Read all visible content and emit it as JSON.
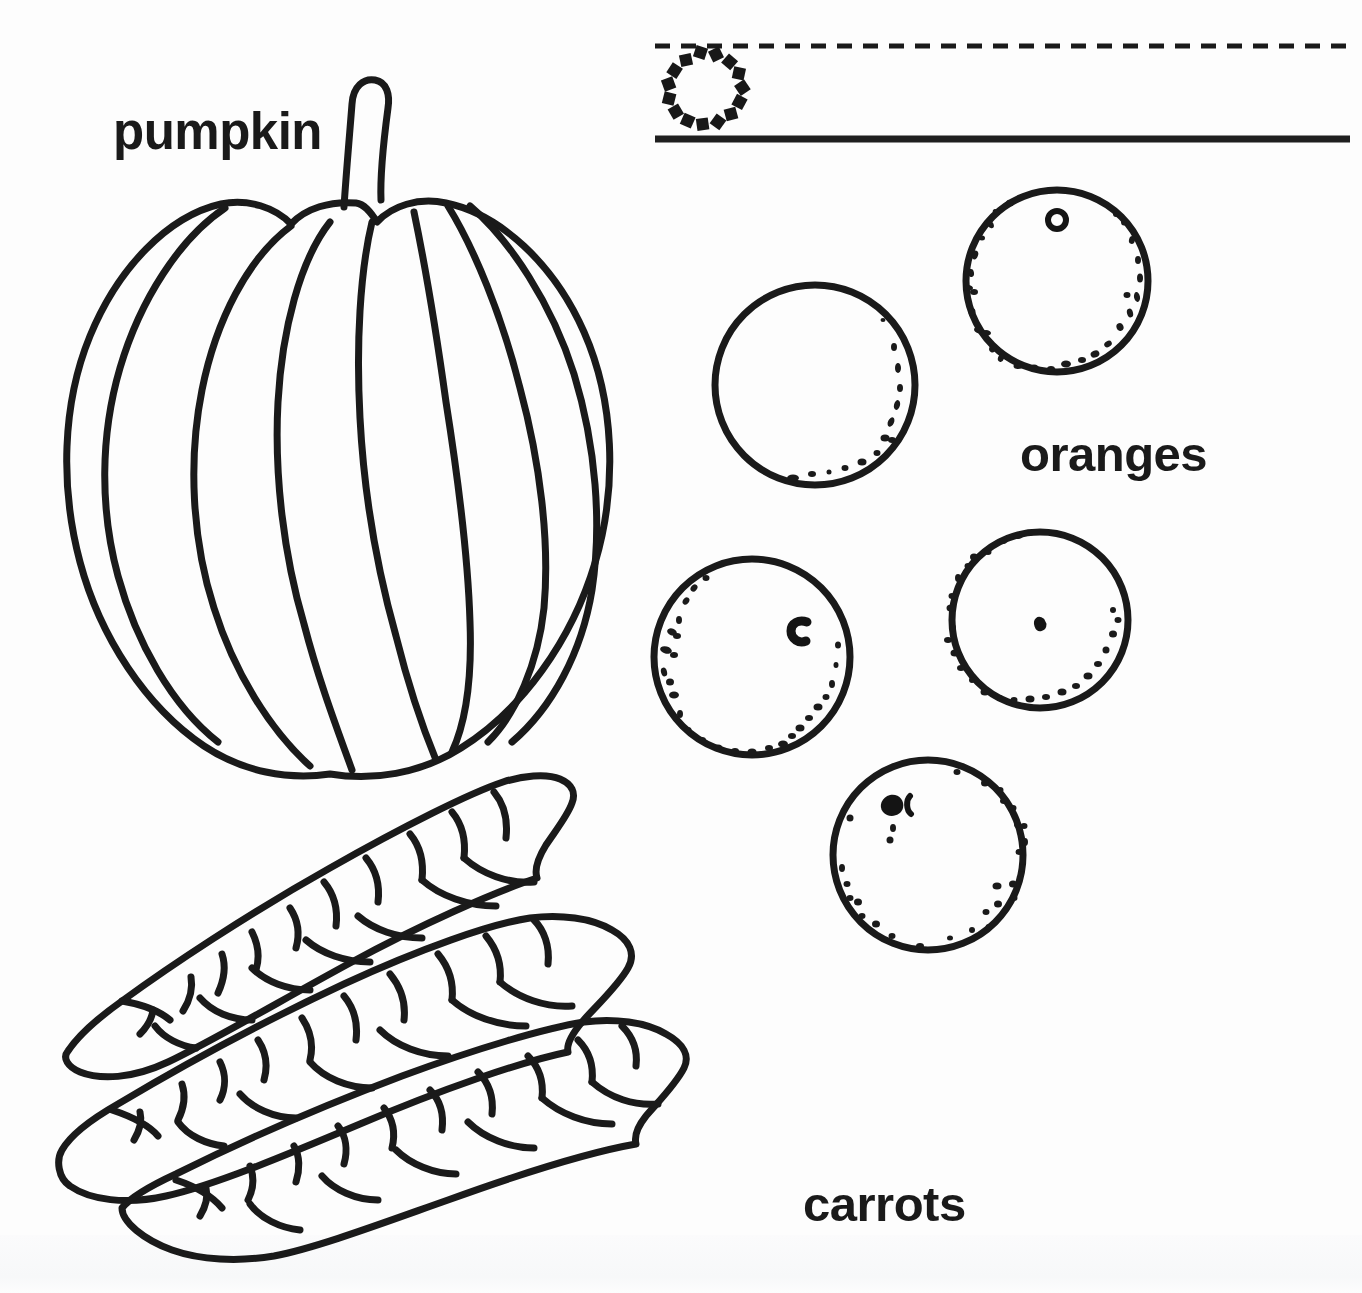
{
  "page": {
    "kind": "worksheet",
    "background_color": "#fdfdfd",
    "ink_color": "#1a1a1a",
    "width": 1362,
    "height": 1293
  },
  "labels": {
    "pumpkin": "pumpkin",
    "oranges": "oranges",
    "carrots": "carrots"
  },
  "tracing_guide": {
    "name": "letter-o-tracing-row",
    "dashed_guideline": {
      "y": 46,
      "x_start": 655,
      "x_end": 1356,
      "dash": "14 10",
      "thickness": 5
    },
    "baseline": {
      "y": 139,
      "x_start": 655,
      "x_end": 1350,
      "thickness": 7
    },
    "dotted_letter": {
      "glyph": "o",
      "center_x": 700,
      "center_y": 91,
      "radius": 39,
      "dot_count": 15
    }
  },
  "illustrations": {
    "pumpkin": {
      "name": "pumpkin-illustration",
      "bounds": {
        "x": 60,
        "y": 76,
        "width": 598,
        "height": 700
      },
      "rib_count": 7,
      "has_stem": true
    },
    "oranges": {
      "name": "oranges-illustration",
      "count": 5,
      "items": [
        {
          "name": "orange-top-right",
          "cx": 1057,
          "cy": 281,
          "r": 91,
          "navel": "ring",
          "stipple": "full"
        },
        {
          "name": "orange-plain-left",
          "cx": 815,
          "cy": 385,
          "r": 100,
          "navel": "none",
          "stipple": "lower-right"
        },
        {
          "name": "orange-middle-left",
          "cx": 752,
          "cy": 657,
          "r": 98,
          "navel": "c-mark",
          "stipple": "full"
        },
        {
          "name": "orange-middle-right",
          "cx": 1040,
          "cy": 620,
          "r": 88,
          "navel": "dot",
          "stipple": "full"
        },
        {
          "name": "orange-bottom",
          "cx": 928,
          "cy": 855,
          "r": 95,
          "navel": "blob",
          "stipple": "full"
        }
      ]
    },
    "carrots": {
      "name": "carrots-illustration",
      "count": 3,
      "orientation": "tips pointing lower-left, stacked diagonally"
    }
  }
}
